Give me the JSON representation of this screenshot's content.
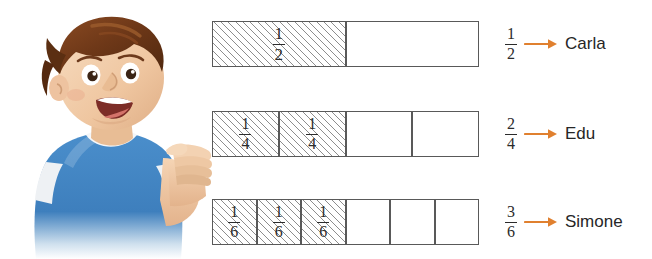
{
  "illustration": {
    "alt": "cartoon-boy-pointing",
    "hair_color": "#6d3a1c",
    "shirt_color": "#3a7fc1",
    "skin_color": "#f0c9a4"
  },
  "arrow_color": "#e0802f",
  "rows": [
    {
      "name": "Carla",
      "fraction": {
        "numerator": "1",
        "denominator": "2"
      },
      "total_parts": 2,
      "shaded_parts": 1,
      "cell_label": {
        "numerator": "1",
        "denominator": "2"
      }
    },
    {
      "name": "Edu",
      "fraction": {
        "numerator": "2",
        "denominator": "4"
      },
      "total_parts": 4,
      "shaded_parts": 2,
      "cell_label": {
        "numerator": "1",
        "denominator": "4"
      }
    },
    {
      "name": "Simone",
      "fraction": {
        "numerator": "3",
        "denominator": "6"
      },
      "total_parts": 6,
      "shaded_parts": 3,
      "cell_label": {
        "numerator": "1",
        "denominator": "6"
      }
    }
  ]
}
